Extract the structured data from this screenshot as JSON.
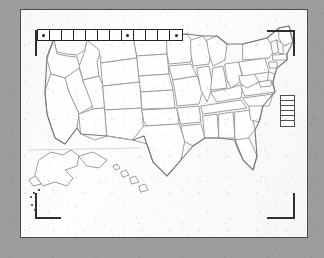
{
  "window": {
    "title": "US Map Viewer",
    "frame_color": "#9d9d9d",
    "canvas_color": "#fdfdfd",
    "border_color": "#4a4a4a"
  },
  "toolbar": {
    "name": "map-tool-palette",
    "button_count": 12,
    "selected_indices": [
      0,
      7,
      11
    ],
    "buttons": [
      {
        "label": "",
        "state": "selected"
      },
      {
        "label": "",
        "state": "normal"
      },
      {
        "label": "",
        "state": "normal"
      },
      {
        "label": "",
        "state": "normal"
      },
      {
        "label": "",
        "state": "normal"
      },
      {
        "label": "",
        "state": "normal"
      },
      {
        "label": "",
        "state": "normal"
      },
      {
        "label": "",
        "state": "selected"
      },
      {
        "label": "",
        "state": "normal"
      },
      {
        "label": "",
        "state": "normal"
      },
      {
        "label": "",
        "state": "normal"
      },
      {
        "label": "",
        "state": "selected"
      }
    ]
  },
  "legend": {
    "title": "",
    "cell_count": 6,
    "cells": [
      {
        "label": ""
      },
      {
        "label": ""
      },
      {
        "label": ""
      },
      {
        "label": ""
      },
      {
        "label": ""
      },
      {
        "label": ""
      }
    ]
  },
  "crop_marks": {
    "top_left": "crop-bracket-top-left",
    "top_right": "crop-bracket-top-right",
    "bottom_left": "crop-bracket-bottom-left",
    "bottom_right": "crop-bracket-bottom-right"
  },
  "map": {
    "region": "United States",
    "title": "",
    "insets": [
      "Alaska",
      "Hawaii"
    ],
    "marker_count": 6
  },
  "chart_data": {
    "type": "map",
    "title": "",
    "region": "United States",
    "projection": "albers-usa",
    "features": [
      "contiguous-states",
      "alaska-inset",
      "hawaii-inset"
    ],
    "legend_classes": 6,
    "values": []
  }
}
